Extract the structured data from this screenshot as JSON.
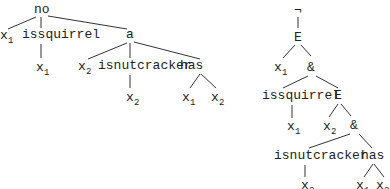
{
  "left_tree": {
    "root": "no",
    "n_x1": "x",
    "n_x1_sub": "1",
    "issquirrel": "issquirrel",
    "issq_x": "x",
    "issq_x_sub": "1",
    "a": "a",
    "a_x2": "x",
    "a_x2_sub": "2",
    "isnutcracker": "isnutcracker",
    "isnut_x": "x",
    "isnut_x_sub": "2",
    "has": "has",
    "has_x1": "x",
    "has_x1_sub": "1",
    "has_x2": "x",
    "has_x2_sub": "2"
  },
  "right_tree": {
    "neg": "¬",
    "E1": "E",
    "E1_x": "x",
    "E1_x_sub": "1",
    "and1": "&",
    "issquirrel": "issquirrel",
    "issq_x": "x",
    "issq_x_sub": "1",
    "E2": "E",
    "E2_x": "x",
    "E2_x_sub": "2",
    "and2": "&",
    "isnutcracker": "isnutcracker",
    "isnut_x": "x",
    "isnut_x_sub": "2",
    "has": "has",
    "has_x1": "x",
    "has_x1_sub": "1",
    "has_x2": "x",
    "has_x2_sub": "2"
  }
}
